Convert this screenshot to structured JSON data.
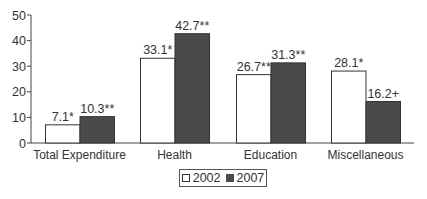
{
  "chart_data": {
    "type": "bar",
    "title": "",
    "xlabel": "",
    "ylabel": "",
    "ylim": [
      0,
      50
    ],
    "yticks": [
      0,
      10,
      20,
      30,
      40,
      50
    ],
    "grid": false,
    "legend_position": "bottom",
    "categories": [
      "Total Expenditure",
      "Health",
      "Education",
      "Miscellaneous"
    ],
    "series": [
      {
        "name": "2002",
        "color": "#ffffff",
        "values": [
          7.1,
          33.1,
          26.7,
          28.1
        ],
        "labels": [
          "7.1*",
          "33.1*",
          "26.7**",
          "28.1*"
        ]
      },
      {
        "name": "2007",
        "color": "#4a4a4a",
        "values": [
          10.3,
          42.7,
          31.3,
          16.2
        ],
        "labels": [
          "10.3**",
          "42.7**",
          "31.3**",
          "16.2+"
        ]
      }
    ]
  },
  "legend": {
    "items": [
      "2002",
      "2007"
    ]
  }
}
